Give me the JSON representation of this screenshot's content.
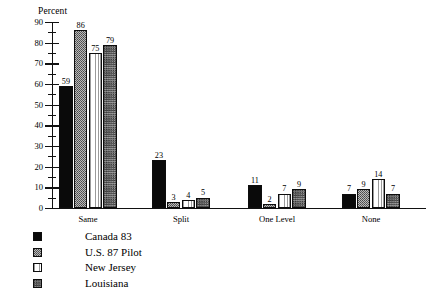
{
  "chart_data": {
    "type": "bar",
    "title": "",
    "xlabel": "",
    "ylabel": "Percent",
    "ylim": [
      0,
      90
    ],
    "ytick_step": 10,
    "yticks": [
      0,
      10,
      20,
      30,
      40,
      50,
      60,
      70,
      80,
      90
    ],
    "ytick_labels": [
      "0",
      "10",
      "20",
      "30",
      "40",
      "50",
      "60",
      "70",
      "80",
      "90"
    ],
    "grid": false,
    "legend_position": "bottom-left",
    "categories": [
      "Same",
      "Split",
      "One Level",
      "None"
    ],
    "series": [
      {
        "name": "Canada 83",
        "pattern": "solid-black",
        "values": [
          59,
          23,
          11,
          7
        ]
      },
      {
        "name": "U.S. 87 Pilot",
        "pattern": "stipple-gray",
        "values": [
          86,
          3,
          2,
          9
        ]
      },
      {
        "name": "New Jersey",
        "pattern": "vertical-stripe",
        "values": [
          75,
          4,
          7,
          14
        ]
      },
      {
        "name": "Louisiana",
        "pattern": "cross-hatch",
        "values": [
          79,
          5,
          9,
          7
        ]
      }
    ],
    "value_labels": [
      [
        "59",
        "86",
        "75",
        "79"
      ],
      [
        "23",
        "3",
        "4",
        "5"
      ],
      [
        "11",
        "2",
        "7",
        "9"
      ],
      [
        "7",
        "9",
        "14",
        "7"
      ]
    ],
    "colors": {
      "axis": "#111111",
      "text": "#000000",
      "background": "#ffffff",
      "series_solid": "#0a0a0a",
      "series_stipple": "#b9b9b9",
      "series_vstripe": "#fdfdfd",
      "series_crosshatch": "#9e9e9e"
    }
  }
}
